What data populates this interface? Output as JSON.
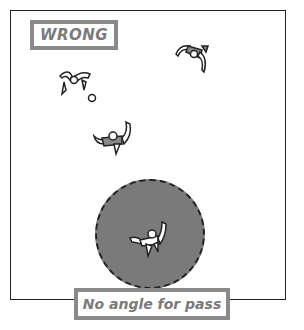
{
  "diagram": {
    "title_label": "WRONG",
    "caption": "No angle for pass",
    "colors": {
      "label_border": "#8a8a8a",
      "label_text": "#7a7a7a",
      "zone_fill": "#7a7a7a",
      "outline": "#222222"
    },
    "elements": [
      {
        "type": "player",
        "team": "attacker",
        "position": "top-left",
        "has_ball": true
      },
      {
        "type": "player",
        "team": "defender",
        "position": "top-right"
      },
      {
        "type": "player",
        "team": "defender",
        "position": "middle"
      },
      {
        "type": "player",
        "team": "attacker",
        "position": "bottom-center",
        "in_pressure_zone": true
      },
      {
        "type": "pressure-zone",
        "shape": "dashed-circle"
      }
    ]
  }
}
